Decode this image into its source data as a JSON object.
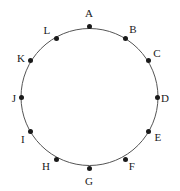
{
  "figure": {
    "type": "circle-with-labeled-points",
    "background_color": "#ffffff",
    "stroke_color": "#555555",
    "point_color": "#1a1a1a",
    "label_color": "#1a1a1a",
    "circle": {
      "center_x": 89.5,
      "center_y": 97,
      "radius": 68.5,
      "stroke_width": 1
    },
    "points": [
      {
        "label": "A",
        "angle_deg": 90,
        "x": 89.5,
        "y": 26.0,
        "label_x": 89,
        "label_y": 13
      },
      {
        "label": "B",
        "angle_deg": 60,
        "x": 125.9,
        "y": 38.5,
        "label_x": 133,
        "label_y": 29
      },
      {
        "label": "C",
        "angle_deg": 30,
        "x": 148.3,
        "y": 60.9,
        "label_x": 157,
        "label_y": 53
      },
      {
        "label": "D",
        "angle_deg": 0,
        "x": 157.0,
        "y": 97.0,
        "label_x": 165,
        "label_y": 98
      },
      {
        "label": "E",
        "angle_deg": 330,
        "x": 148.3,
        "y": 131.5,
        "label_x": 158,
        "label_y": 137
      },
      {
        "label": "F",
        "angle_deg": 300,
        "x": 125.9,
        "y": 159.5,
        "label_x": 132,
        "label_y": 166
      },
      {
        "label": "G",
        "angle_deg": 270,
        "x": 89.5,
        "y": 168.0,
        "label_x": 89,
        "label_y": 181
      },
      {
        "label": "H",
        "angle_deg": 240,
        "x": 56.0,
        "y": 159.5,
        "label_x": 46,
        "label_y": 166
      },
      {
        "label": "I",
        "angle_deg": 210,
        "x": 30.3,
        "y": 131.5,
        "label_x": 23,
        "label_y": 139
      },
      {
        "label": "J",
        "angle_deg": 180,
        "x": 21.5,
        "y": 97.0,
        "label_x": 14,
        "label_y": 98
      },
      {
        "label": "K",
        "angle_deg": 150,
        "x": 30.3,
        "y": 60.9,
        "label_x": 21,
        "label_y": 58
      },
      {
        "label": "L",
        "angle_deg": 120,
        "x": 56.0,
        "y": 38.5,
        "label_x": 47,
        "label_y": 30
      }
    ]
  }
}
